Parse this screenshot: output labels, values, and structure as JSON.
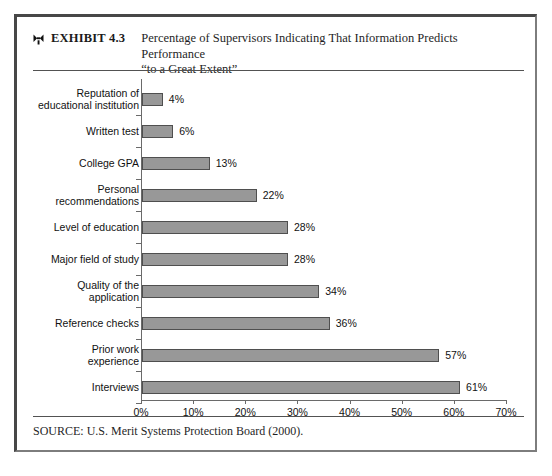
{
  "exhibit": {
    "marker_icon": "bowtie-ornament-icon",
    "number_label": "EXHIBIT 4.3",
    "title_line_1": "Percentage of Supervisors Indicating That Information Predicts Performance",
    "title_line_2": "“to a Great Extent”",
    "source": "SOURCE: U.S. Merit Systems Protection Board (2000)."
  },
  "chart_data": {
    "type": "bar",
    "orientation": "horizontal",
    "title": "Percentage of Supervisors Indicating That Information Predicts Performance “to a Great Extent”",
    "xlabel": "",
    "ylabel": "",
    "xlim": [
      0,
      70
    ],
    "grid": false,
    "legend": false,
    "bar_color": "#989898",
    "bar_edge_color": "#4f4f4f",
    "axis_color": "#6a6a6a",
    "xticks": [
      "0%",
      "10%",
      "20%",
      "30%",
      "40%",
      "50%",
      "60%",
      "70%"
    ],
    "xtick_values": [
      0,
      10,
      20,
      30,
      40,
      50,
      60,
      70
    ],
    "categories": [
      "Reputation of educational institution",
      "Written test",
      "College GPA",
      "Personal recommendations",
      "Level of education",
      "Major field of study",
      "Quality of the application",
      "Reference checks",
      "Prior work experience",
      "Interviews"
    ],
    "category_lines": [
      [
        "Reputation of",
        "educational institution"
      ],
      [
        "Written test"
      ],
      [
        "College GPA"
      ],
      [
        "Personal",
        "recommendations"
      ],
      [
        "Level of education"
      ],
      [
        "Major field of study"
      ],
      [
        "Quality of the",
        "application"
      ],
      [
        "Reference checks"
      ],
      [
        "Prior work",
        "experience"
      ],
      [
        "Interviews"
      ]
    ],
    "values": [
      4,
      6,
      13,
      22,
      28,
      28,
      34,
      36,
      57,
      61
    ],
    "value_labels": [
      "4%",
      "6%",
      "13%",
      "22%",
      "28%",
      "28%",
      "34%",
      "36%",
      "57%",
      "61%"
    ]
  }
}
